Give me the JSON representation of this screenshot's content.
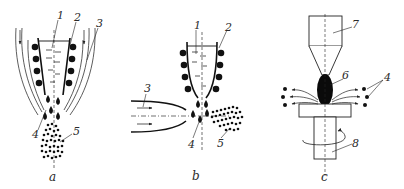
{
  "diagram": {
    "colors": {
      "ink": "#1a1a1a",
      "line": "#333333",
      "background": "#ffffff"
    },
    "panels": [
      {
        "id": "a",
        "caption": "a",
        "labels": {
          "n1": "1",
          "n2": "2",
          "n3": "3",
          "n4": "4",
          "n5": "5"
        },
        "parts": [
          "crucible-with-melt",
          "heating-coils",
          "gas-flow-streams",
          "droplets",
          "powder-particles"
        ]
      },
      {
        "id": "b",
        "caption": "b",
        "labels": {
          "n1": "1",
          "n2": "2",
          "n3": "3",
          "n4": "4",
          "n5": "5"
        },
        "parts": [
          "crucible-with-melt",
          "heating-coils",
          "horizontal-gas-nozzle",
          "droplets",
          "powder-particles"
        ]
      },
      {
        "id": "c",
        "caption": "c",
        "labels": {
          "n4": "4",
          "n6": "6",
          "n7": "7",
          "n8": "8"
        },
        "parts": [
          "electrode-holder",
          "molten-drop",
          "ejected-particles",
          "rotating-disk-shaft"
        ]
      }
    ]
  }
}
